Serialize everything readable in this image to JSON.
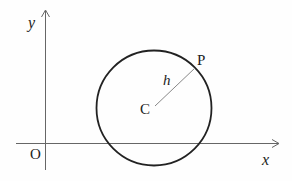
{
  "diagram": {
    "type": "coordinate-geometry",
    "axes": {
      "x_label": "x",
      "y_label": "y",
      "origin_label": "O"
    },
    "circle": {
      "center_label": "C",
      "point_label": "P",
      "radius_label": "h"
    },
    "colors": {
      "axis": "#555555",
      "circle": "#222222",
      "radius": "#777777",
      "text": "#222222"
    }
  }
}
